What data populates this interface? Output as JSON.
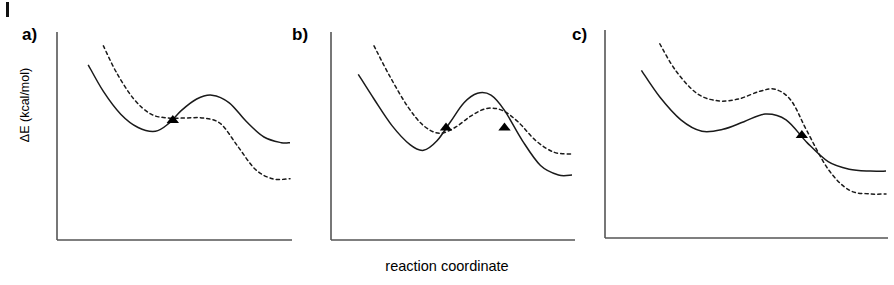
{
  "figure": {
    "xlabel": "reaction coordinate",
    "ylabel": "ΔE (kcal/mol)",
    "panels": [
      {
        "id": "a",
        "label": "a)"
      },
      {
        "id": "b",
        "label": "b)"
      },
      {
        "id": "c",
        "label": "c)"
      }
    ]
  },
  "chart_data": {
    "type": "line",
    "title": "",
    "xlabel": "reaction coordinate",
    "ylabel": "ΔE (kcal/mol)",
    "grid": false,
    "legend": "none",
    "axis_ticks": "none",
    "note": "Three schematic potential-energy surfaces along a reaction coordinate. Each panel overlays a solid curve and a dashed curve; filled triangles mark the points where the two curves cross (surface-crossing / intersystem-crossing points). Axis values are qualitative - no numeric tick labels are printed.",
    "colors": {
      "solid_curve": "#1a1a1a",
      "dashed_curve": "#1a1a1a",
      "axis": "#555555",
      "marker": "#000000"
    },
    "panels": [
      {
        "id": "a",
        "label": "a)",
        "description": "Solid curve falls to a shallow minimum, rises to a barrier maximum, then falls to a high plateau. Dashed curve starts higher, flattens through the crossing region and drops to a lower plateau. One crossing point.",
        "axis": {
          "x_range": [
            0,
            100
          ],
          "y_range": [
            0,
            100
          ]
        },
        "series": [
          {
            "name": "solid",
            "style": "solid",
            "x": [
              7,
              14,
              22,
              30,
              38,
              44,
              50,
              57,
              64,
              72,
              80,
              88,
              96,
              100
            ],
            "y": [
              88,
              74,
              62,
              55,
              53,
              57,
              64,
              70,
              72,
              68,
              58,
              50,
              47,
              47
            ]
          },
          {
            "name": "dashed",
            "style": "dashed",
            "x": [
              14,
              20,
              28,
              36,
              44,
              52,
              60,
              68,
              76,
              84,
              92,
              100
            ],
            "y": [
              98,
              84,
              70,
              62,
              60,
              60,
              60,
              57,
              45,
              33,
              28,
              28
            ]
          }
        ],
        "markers": [
          {
            "name": "crossing-point",
            "shape": "filled-triangle",
            "x": 46,
            "y": 59
          }
        ]
      },
      {
        "id": "b",
        "label": "b)",
        "description": "Solid curve descends to a deep minimum, rises to a tall barrier, then falls to a low plateau. Dashed curve lies above through the well, has a lower barrier, and ends at a higher plateau. Two crossing points, one on each side of the barrier.",
        "axis": {
          "x_range": [
            0,
            100
          ],
          "y_range": [
            0,
            100
          ]
        },
        "series": [
          {
            "name": "solid",
            "style": "solid",
            "x": [
              5,
              12,
              20,
              28,
              34,
              40,
              46,
              52,
              58,
              64,
              70,
              78,
              86,
              94,
              100
            ],
            "y": [
              83,
              70,
              56,
              46,
              43,
              48,
              58,
              68,
              73,
              72,
              64,
              48,
              35,
              30,
              30
            ]
          },
          {
            "name": "dashed",
            "style": "dashed",
            "x": [
              12,
              19,
              27,
              34,
              41,
              48,
              55,
              62,
              69,
              76,
              84,
              92,
              100
            ],
            "y": [
              98,
              82,
              66,
              56,
              52,
              55,
              61,
              65,
              64,
              58,
              48,
              42,
              41
            ]
          }
        ],
        "markers": [
          {
            "name": "crossing-point-1",
            "shape": "filled-triangle",
            "x": 44,
            "y": 55
          },
          {
            "name": "crossing-point-2",
            "shape": "filled-triangle",
            "x": 70,
            "y": 55
          }
        ]
      },
      {
        "id": "c",
        "label": "c)",
        "description": "Solid curve falls to a broad shallow minimum, rises to a low hump, then drops to a plateau. Dashed curve runs parallel above it and crosses downward on the falling edge, ending below the solid plateau. One crossing point on the descending limb.",
        "axis": {
          "x_range": [
            0,
            100
          ],
          "y_range": [
            0,
            100
          ]
        },
        "series": [
          {
            "name": "solid",
            "style": "solid",
            "x": [
              7,
              14,
              22,
              30,
              38,
              46,
              54,
              62,
              70,
              78,
              86,
              94,
              100
            ],
            "y": [
              84,
              70,
              58,
              52,
              53,
              57,
              61,
              58,
              46,
              36,
              32,
              31,
              31
            ]
          },
          {
            "name": "dashed",
            "style": "dashed",
            "x": [
              14,
              20,
              28,
              36,
              44,
              52,
              58,
              64,
              70,
              78,
              86,
              94,
              100
            ],
            "y": [
              98,
              84,
              72,
              68,
              69,
              73,
              74,
              68,
              52,
              32,
              21,
              19,
              19
            ]
          }
        ],
        "markers": [
          {
            "name": "crossing-point",
            "shape": "filled-triangle",
            "x": 68,
            "y": 50
          }
        ]
      }
    ]
  }
}
